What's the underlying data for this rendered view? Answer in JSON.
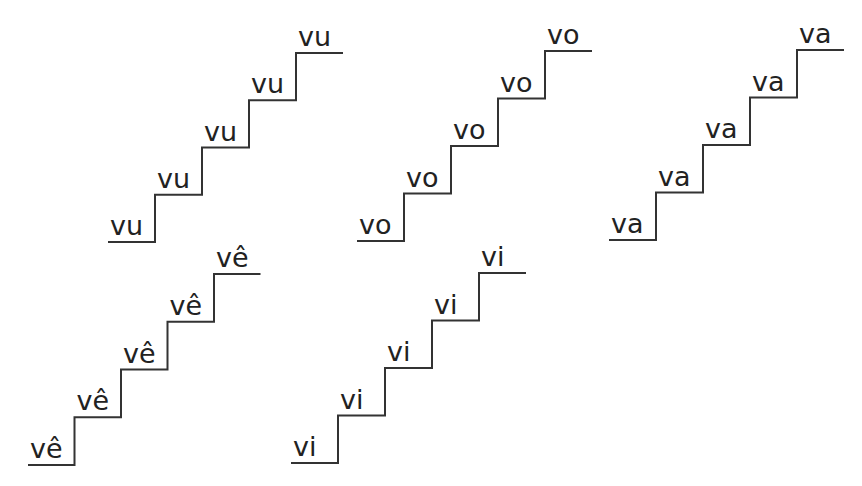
{
  "worksheet": {
    "line_color": "#333333",
    "staircases": [
      {
        "name": "vu",
        "steps": [
          "vu",
          "vu",
          "vu",
          "vu",
          "vu"
        ],
        "origin_x": 108,
        "bottom_y": 242,
        "step_w": 47,
        "step_h": 47.25
      },
      {
        "name": "vo",
        "steps": [
          "vo",
          "vo",
          "vo",
          "vo",
          "vo"
        ],
        "origin_x": 357,
        "bottom_y": 241,
        "step_w": 47,
        "step_h": 47.5
      },
      {
        "name": "va",
        "steps": [
          "va",
          "va",
          "va",
          "va",
          "va"
        ],
        "origin_x": 609,
        "bottom_y": 240,
        "step_w": 47,
        "step_h": 47.5
      },
      {
        "name": "ve-circumflex",
        "steps": [
          "vê",
          "vê",
          "vê",
          "vê",
          "vê"
        ],
        "origin_x": 28,
        "bottom_y": 465,
        "step_w": 46.5,
        "step_h": 47.75
      },
      {
        "name": "vi",
        "steps": [
          "vi",
          "vi",
          "vi",
          "vi",
          "vi"
        ],
        "origin_x": 291,
        "bottom_y": 463,
        "step_w": 47,
        "step_h": 47.5
      }
    ]
  }
}
